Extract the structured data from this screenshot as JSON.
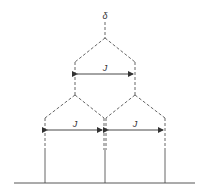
{
  "diagram": {
    "type": "NMR splitting tree (doublet of doublets, equal J → triplet 1:2:1)",
    "labels": {
      "delta": "δ",
      "coupling_top": "J",
      "coupling_left": "J",
      "coupling_right": "J"
    },
    "line_color": "#555555",
    "levels": [
      {
        "name": "chemical-shift",
        "lines": 1
      },
      {
        "name": "first-splitting",
        "lines": 2
      },
      {
        "name": "second-splitting",
        "lines": 3
      }
    ]
  }
}
